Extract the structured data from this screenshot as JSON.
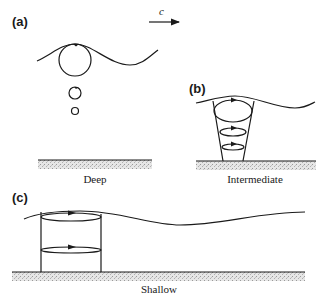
{
  "figure": {
    "wave_speed_label": "c",
    "colors": {
      "ink": "#1a1a1a",
      "seabed": "#c8c8c8",
      "background": "#ffffff"
    },
    "panels": [
      {
        "id": "a",
        "label": "(a)",
        "depth_label": "Deep",
        "orbit_shape": "circles decreasing with depth"
      },
      {
        "id": "b",
        "label": "(b)",
        "depth_label": "Intermediate",
        "orbit_shape": "ellipses flattening with depth"
      },
      {
        "id": "c",
        "label": "(c)",
        "depth_label": "Shallow",
        "orbit_shape": "flat ellipses of equal width"
      }
    ]
  }
}
